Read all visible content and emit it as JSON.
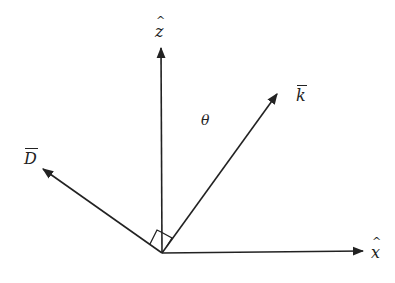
{
  "diagram": {
    "type": "vector-diagram",
    "colors": {
      "stroke": "#222222",
      "background": "#ffffff"
    },
    "origin": [
      162,
      253
    ],
    "vectors": [
      {
        "id": "z-axis",
        "label": "z",
        "decoration": "hat",
        "tip": [
          161,
          48
        ]
      },
      {
        "id": "x-axis",
        "label": "x",
        "decoration": "hat",
        "tip": [
          363,
          251
        ]
      },
      {
        "id": "k-vector",
        "label": "k",
        "decoration": "bar",
        "tip": [
          277,
          94
        ]
      },
      {
        "id": "d-vector",
        "label": "D",
        "decoration": "bar",
        "tip": [
          43,
          169
        ]
      }
    ],
    "angle_label": "θ",
    "right_angle_markers": [
      "D-z",
      "z-k"
    ]
  },
  "labels": {
    "z": "z",
    "x": "x",
    "k": "k",
    "d": "D",
    "theta": "θ"
  }
}
